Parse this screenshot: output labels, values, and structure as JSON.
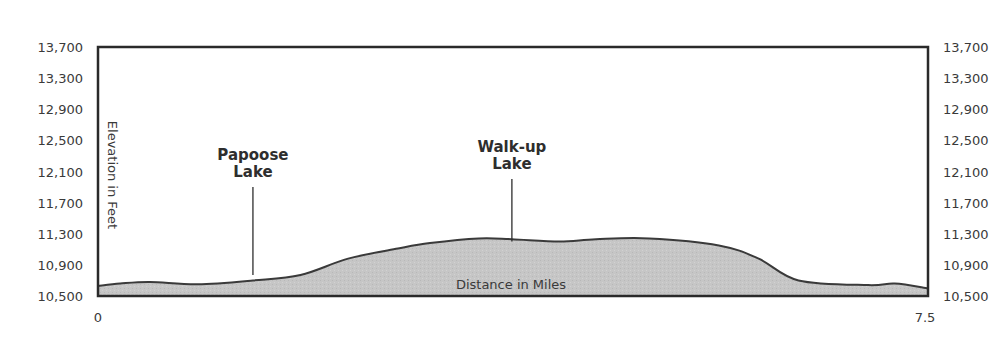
{
  "chart_data": {
    "type": "area",
    "title": "",
    "xlabel": "Distance in Miles",
    "ylabel": "Elevation in Feet",
    "xlim": [
      0,
      7.5
    ],
    "ylim": [
      10500,
      13700
    ],
    "x_ticks": [
      "0",
      "7.5"
    ],
    "y_ticks": [
      "13,700",
      "13,300",
      "12,900",
      "12,500",
      "12,100",
      "11,700",
      "11,300",
      "10,900",
      "10,500"
    ],
    "y_tick_values": [
      13700,
      13300,
      12900,
      12500,
      12100,
      11700,
      11300,
      10900,
      10500
    ],
    "y_axis_both_sides": true,
    "grid": false,
    "legend": null,
    "series": [
      {
        "name": "Elevation profile",
        "x": [
          0,
          0.2,
          0.47,
          0.9,
          1.4,
          1.83,
          2.26,
          2.71,
          3.0,
          3.44,
          3.74,
          4.17,
          4.5,
          4.98,
          5.61,
          5.97,
          6.33,
          6.96,
          7.2,
          7.5
        ],
        "y": [
          10630,
          10660,
          10680,
          10650,
          10700,
          10770,
          10980,
          11110,
          11180,
          11240,
          11230,
          11200,
          11230,
          11240,
          11150,
          10980,
          10700,
          10640,
          10660,
          10600
        ]
      }
    ],
    "annotations": [
      {
        "label_line1": "Papoose",
        "label_line2": "Lake",
        "x": 1.4,
        "y": 10770
      },
      {
        "label_line1": "Walk-up",
        "label_line2": "Lake",
        "x": 3.74,
        "y": 11200
      }
    ],
    "colors": {
      "fill": "#c8c8c8",
      "outline": "#3a3a3a",
      "frame": "#2a2a2a"
    }
  }
}
